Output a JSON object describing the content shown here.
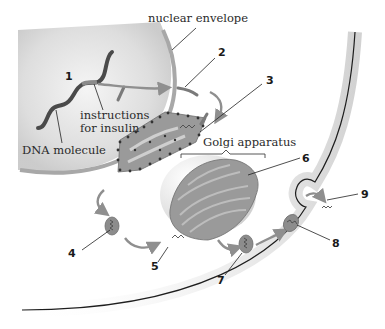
{
  "labels": {
    "nuclear_envelope": "nuclear envelope",
    "instructions_line1": "instructions",
    "instructions_line2": "for insulin",
    "dna_molecule": "DNA molecule",
    "golgi_apparatus": "Golgi apparatus"
  },
  "steps": [
    {
      "number": "1",
      "target": "DNA / instructions for insulin"
    },
    {
      "number": "2",
      "target": "mRNA leaving nucleus"
    },
    {
      "number": "3",
      "target": "ribosome on rough ER"
    },
    {
      "number": "4",
      "target": "transport vesicle"
    },
    {
      "number": "5",
      "target": "vesicle fusing with Golgi"
    },
    {
      "number": "6",
      "target": "Golgi apparatus"
    },
    {
      "number": "7",
      "target": "secretory vesicle"
    },
    {
      "number": "8",
      "target": "vesicle at cell membrane"
    },
    {
      "number": "9",
      "target": "insulin released outside cell"
    }
  ],
  "colors": {
    "organelle": "#8c8c8c",
    "arrow": "#8f8f8f",
    "membrane": "#1e1e1e",
    "nucleus_shade": "#d9d9d9",
    "dna": "#4a4a4a"
  }
}
